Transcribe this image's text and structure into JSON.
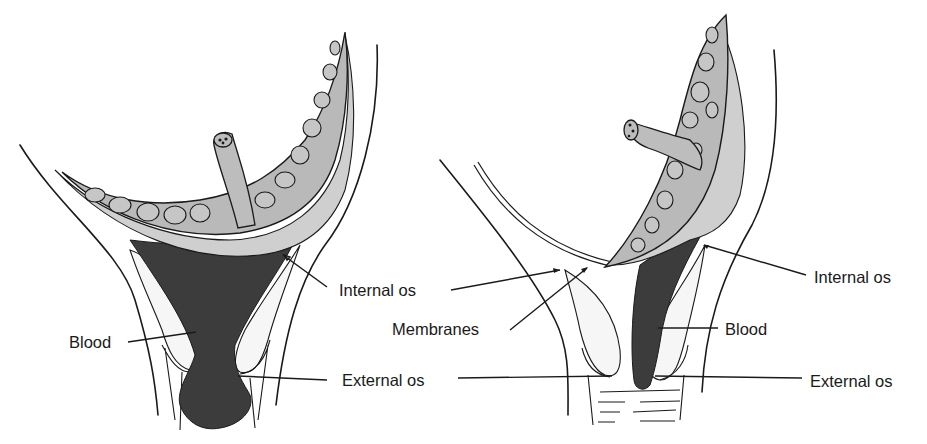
{
  "figure": {
    "panels": [
      {
        "id": "left",
        "labels": {
          "internal_os": "Internal os",
          "blood": "Blood",
          "external_os": "External os"
        }
      },
      {
        "id": "right",
        "labels": {
          "internal_os_left": "Internal os",
          "membranes": "Membranes",
          "internal_os": "Internal os",
          "blood": "Blood",
          "external_os": "External os"
        }
      }
    ],
    "colors": {
      "line": "#1a1a1a",
      "placenta_fill": "#b9b9b9",
      "blood_fill": "#3c3c3c",
      "background": "#ffffff"
    }
  }
}
